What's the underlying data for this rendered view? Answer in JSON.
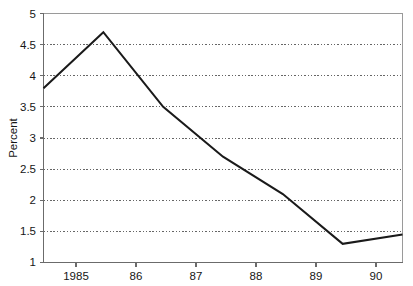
{
  "chart_data": {
    "type": "line",
    "title": "",
    "xlabel": "",
    "ylabel": "Percent",
    "x": [
      1985,
      1986,
      1987,
      1988,
      1989,
      1990,
      1991
    ],
    "categories": [
      "1985",
      "86",
      "87",
      "88",
      "89",
      "90",
      ""
    ],
    "values": [
      3.8,
      4.7,
      3.5,
      2.7,
      2.1,
      1.3,
      1.45
    ],
    "series": [
      {
        "name": "Percent",
        "values": [
          3.8,
          4.7,
          3.5,
          2.7,
          2.1,
          1.3,
          1.45
        ]
      }
    ],
    "xlim": [
      1985,
      1991
    ],
    "ylim": [
      1,
      5
    ],
    "x_tick_labels": [
      "1985",
      "86",
      "87",
      "88",
      "89",
      "90"
    ],
    "x_tick_values": [
      1985,
      1986,
      1987,
      1988,
      1989,
      1990
    ],
    "y_tick_labels": [
      "5",
      "4.5",
      "4",
      "3.5",
      "3",
      "2.5",
      "2",
      "1.5",
      "1"
    ],
    "y_tick_values": [
      5,
      4.5,
      4,
      3.5,
      3,
      2.5,
      2,
      1.5,
      1
    ],
    "grid": "horizontal-dotted",
    "legend": "none",
    "line_color": "#1a1a1a",
    "grid_color": "#555555",
    "axis_color": "#6b6b6b",
    "background_color": "#ffffff"
  },
  "axes": {
    "y_title": "Percent"
  },
  "title_sliver": {
    "text": ""
  }
}
